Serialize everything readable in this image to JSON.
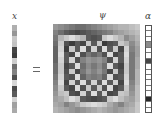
{
  "labels": {
    "x": "x",
    "psi": "ψ",
    "alpha": "α",
    "equals": "="
  },
  "x_vector": [
    175,
    150,
    200,
    195,
    70,
    60,
    205,
    110,
    130,
    80,
    215,
    75,
    90,
    210,
    160,
    170
  ],
  "alpha_vector": [
    255,
    255,
    255,
    140,
    255,
    255,
    70,
    255,
    255,
    255,
    255,
    255,
    255,
    40,
    255,
    255
  ],
  "psi_matrix": [
    [
      150,
      140,
      130,
      120,
      110,
      110,
      120,
      130,
      140,
      150,
      160,
      170,
      180,
      180,
      190,
      200
    ],
    [
      130,
      110,
      90,
      80,
      70,
      80,
      90,
      100,
      110,
      120,
      130,
      150,
      160,
      170,
      180,
      190
    ],
    [
      120,
      180,
      200,
      220,
      200,
      180,
      90,
      80,
      90,
      200,
      220,
      200,
      180,
      140,
      160,
      180
    ],
    [
      110,
      200,
      80,
      60,
      90,
      70,
      200,
      90,
      200,
      60,
      80,
      90,
      200,
      180,
      140,
      170
    ],
    [
      100,
      210,
      60,
      200,
      90,
      220,
      80,
      210,
      80,
      220,
      90,
      200,
      70,
      210,
      130,
      160
    ],
    [
      100,
      220,
      90,
      70,
      220,
      80,
      120,
      100,
      120,
      80,
      220,
      70,
      90,
      220,
      120,
      160
    ],
    [
      100,
      210,
      90,
      210,
      80,
      130,
      150,
      140,
      150,
      130,
      80,
      210,
      90,
      210,
      120,
      170
    ],
    [
      110,
      200,
      70,
      90,
      220,
      110,
      140,
      120,
      140,
      110,
      220,
      90,
      70,
      200,
      120,
      170
    ],
    [
      110,
      200,
      80,
      200,
      70,
      120,
      150,
      130,
      150,
      120,
      70,
      200,
      80,
      200,
      120,
      180
    ],
    [
      120,
      210,
      90,
      80,
      220,
      100,
      130,
      120,
      130,
      100,
      220,
      80,
      90,
      210,
      120,
      180
    ],
    [
      130,
      220,
      70,
      210,
      90,
      220,
      90,
      210,
      90,
      220,
      90,
      210,
      70,
      220,
      130,
      180
    ],
    [
      140,
      200,
      90,
      70,
      220,
      80,
      200,
      90,
      200,
      80,
      220,
      70,
      90,
      200,
      140,
      190
    ],
    [
      150,
      190,
      200,
      80,
      70,
      210,
      90,
      220,
      90,
      210,
      70,
      80,
      200,
      190,
      150,
      190
    ],
    [
      160,
      170,
      190,
      220,
      200,
      90,
      80,
      70,
      80,
      90,
      200,
      220,
      190,
      170,
      160,
      190
    ],
    [
      170,
      160,
      130,
      150,
      170,
      200,
      210,
      220,
      210,
      200,
      170,
      150,
      130,
      160,
      170,
      200
    ],
    [
      180,
      170,
      160,
      150,
      140,
      150,
      160,
      170,
      180,
      170,
      160,
      150,
      160,
      170,
      180,
      200
    ]
  ]
}
